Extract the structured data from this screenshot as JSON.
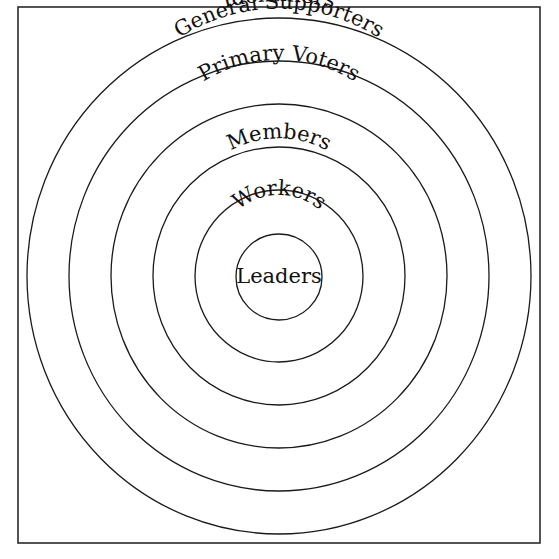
{
  "diagram": {
    "type": "concentric-circles",
    "layers": [
      {
        "label": "Identifiers",
        "level": 1
      },
      {
        "label": "General Supporters",
        "level": 2
      },
      {
        "label": "Primary Voters",
        "level": 3
      },
      {
        "label": "Members",
        "level": 4
      },
      {
        "label": "Workers",
        "level": 5
      },
      {
        "label": "Leaders",
        "level": 6
      }
    ],
    "colors": {
      "stroke": "#1a1a1a",
      "background": "#ffffff",
      "text": "#111111"
    }
  }
}
